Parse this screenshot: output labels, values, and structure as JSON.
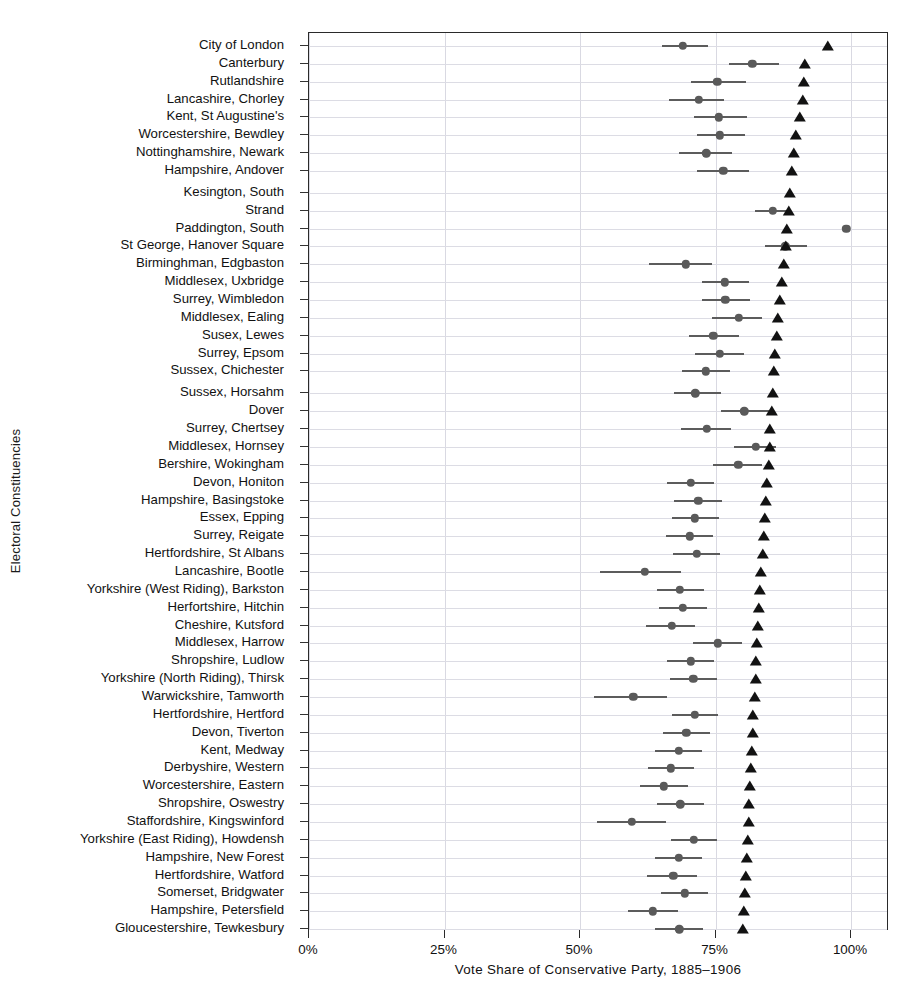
{
  "chart_data": {
    "type": "scatter",
    "title": "",
    "xlabel": "Vote Share of Conservative Party, 1885–1906",
    "ylabel": "Electoral Constituencies",
    "xlim": [
      0,
      107
    ],
    "xticks": [
      0,
      25,
      50,
      75,
      100
    ],
    "xticklabels": [
      "0%",
      "25%",
      "50%",
      "75%",
      "100%"
    ],
    "grid": true,
    "legend": false,
    "series": [
      {
        "name": "estimate-with-confidence-interval",
        "marker": "circle",
        "color": "#5a5a5a"
      },
      {
        "name": "reference-point",
        "marker": "triangle",
        "color": "#121212"
      }
    ],
    "categories": [
      "City of London",
      "Canterbury",
      "Rutlandshire",
      "Lancashire, Chorley",
      "Kent, St Augustine's",
      "Worcestershire, Bewdley",
      "Nottinghamshire, Newark",
      "Hampshire, Andover",
      "Kesington, South",
      "Strand",
      "Paddington, South",
      "St George, Hanover Square",
      "Birminghman, Edgbaston",
      "Middlesex, Uxbridge",
      "Surrey, Wimbledon",
      "Middlesex, Ealing",
      "Susex, Lewes",
      "Surrey, Epsom",
      "Sussex, Chichester",
      "Sussex, Horsahm",
      "Dover",
      "Surrey, Chertsey",
      "Middlesex, Hornsey",
      "Bershire, Wokingham",
      "Devon, Honiton",
      "Hampshire, Basingstoke",
      "Essex, Epping",
      "Surrey, Reigate",
      "Hertfordshire, St Albans",
      "Lancashire, Bootle",
      "Yorkshire (West Riding), Barkston",
      "Herfortshire, Hitchin",
      "Cheshire, Kutsford",
      "Middlesex, Harrow",
      "Shropshire, Ludlow",
      "Yorkshire (North Riding), Thirsk",
      "Warwickshire, Tamworth",
      "Hertfordshire, Hertford",
      "Devon, Tiverton",
      "Kent, Medway",
      "Derbyshire, Western",
      "Worcestershire, Eastern",
      "Shropshire, Oswestry",
      "Staffordshire, Kingswinford",
      "Yorkshire (East Riding), Howdensh",
      "Hampshire, New Forest",
      "Hertfordshire, Watford",
      "Somerset, Bridgwater",
      "Hampshire, Petersfield",
      "Gloucestershire, Tewkesbury"
    ],
    "gap_after_rows": [
      8,
      19
    ],
    "points": [
      {
        "category": "City of London",
        "estimate": 69.0,
        "ci_low": 65.2,
        "ci_high": 73.6,
        "reference": 95.8
      },
      {
        "category": "Canterbury",
        "estimate": 81.8,
        "ci_low": 77.5,
        "ci_high": 86.8,
        "reference": 91.5
      },
      {
        "category": "Rutlandshire",
        "estimate": 75.3,
        "ci_low": 70.5,
        "ci_high": 80.6,
        "reference": 91.4
      },
      {
        "category": "Lancashire, Chorley",
        "estimate": 71.9,
        "ci_low": 66.4,
        "ci_high": 76.5,
        "reference": 91.1
      },
      {
        "category": "Kent, St Augustine's",
        "estimate": 75.6,
        "ci_low": 71.1,
        "ci_high": 80.8,
        "reference": 90.5
      },
      {
        "category": "Worcestershire, Bewdley",
        "estimate": 75.8,
        "ci_low": 71.5,
        "ci_high": 80.4,
        "reference": 89.9
      },
      {
        "category": "Nottinghamshire, Newark",
        "estimate": 73.3,
        "ci_low": 68.2,
        "ci_high": 78.1,
        "reference": 89.5
      },
      {
        "category": "Hampshire, Andover",
        "estimate": 76.4,
        "ci_low": 71.5,
        "ci_high": 81.1,
        "reference": 89.1
      },
      {
        "category": "Kesington, South",
        "estimate": null,
        "ci_low": null,
        "ci_high": null,
        "reference": 88.7
      },
      {
        "category": "Strand",
        "estimate": 85.6,
        "ci_low": 82.3,
        "ci_high": 88.6,
        "reference": 88.5
      },
      {
        "category": "Paddington, South",
        "estimate": 99.1,
        "ci_low": null,
        "ci_high": null,
        "reference": 88.2
      },
      {
        "category": "St George, Hanover Square",
        "estimate": 87.9,
        "ci_low": 84.1,
        "ci_high": 91.9,
        "reference": 88.0
      },
      {
        "category": "Birminghman, Edgbaston",
        "estimate": 69.5,
        "ci_low": 62.8,
        "ci_high": 74.3,
        "reference": 87.6
      },
      {
        "category": "Middlesex, Uxbridge",
        "estimate": 76.7,
        "ci_low": 72.5,
        "ci_high": 81.1,
        "reference": 87.2
      },
      {
        "category": "Surrey, Wimbledon",
        "estimate": 76.8,
        "ci_low": 72.5,
        "ci_high": 81.3,
        "reference": 86.8
      },
      {
        "category": "Middlesex, Ealing",
        "estimate": 79.3,
        "ci_low": 74.4,
        "ci_high": 83.6,
        "reference": 86.6
      },
      {
        "category": "Susex, Lewes",
        "estimate": 74.6,
        "ci_low": 70.1,
        "ci_high": 79.3,
        "reference": 86.3
      },
      {
        "category": "Surrey, Epsom",
        "estimate": 75.8,
        "ci_low": 71.2,
        "ci_high": 80.2,
        "reference": 85.9
      },
      {
        "category": "Sussex, Chichester",
        "estimate": 73.2,
        "ci_low": 68.8,
        "ci_high": 77.6,
        "reference": 85.8
      },
      {
        "category": "Sussex, Horsahm",
        "estimate": 71.3,
        "ci_low": 67.4,
        "ci_high": 76.0,
        "reference": 85.6
      },
      {
        "category": "Dover",
        "estimate": 80.3,
        "ci_low": 76.0,
        "ci_high": 84.8,
        "reference": 85.4
      },
      {
        "category": "Surrey, Chertsey",
        "estimate": 73.4,
        "ci_low": 68.6,
        "ci_high": 77.9,
        "reference": 85.1
      },
      {
        "category": "Middlesex, Hornsey",
        "estimate": 82.4,
        "ci_low": 78.4,
        "ci_high": 86.2,
        "reference": 85.0
      },
      {
        "category": "Bershire, Wokingham",
        "estimate": 79.2,
        "ci_low": 74.5,
        "ci_high": 83.6,
        "reference": 84.8
      },
      {
        "category": "Devon, Honiton",
        "estimate": 70.4,
        "ci_low": 66.0,
        "ci_high": 74.8,
        "reference": 84.5
      },
      {
        "category": "Hampshire, Basingstoke",
        "estimate": 71.8,
        "ci_low": 67.4,
        "ci_high": 76.2,
        "reference": 84.3
      },
      {
        "category": "Essex, Epping",
        "estimate": 71.2,
        "ci_low": 66.9,
        "ci_high": 75.6,
        "reference": 84.1
      },
      {
        "category": "Surrey, Reigate",
        "estimate": 70.3,
        "ci_low": 65.9,
        "ci_high": 74.6,
        "reference": 83.9
      },
      {
        "category": "Hertfordshire, St Albans",
        "estimate": 71.5,
        "ci_low": 67.2,
        "ci_high": 75.8,
        "reference": 83.7
      },
      {
        "category": "Lancashire, Bootle",
        "estimate": 62.0,
        "ci_low": 53.6,
        "ci_high": 68.7,
        "reference": 83.4
      },
      {
        "category": "Yorkshire (West Riding), Barkston",
        "estimate": 68.4,
        "ci_low": 64.2,
        "ci_high": 72.9,
        "reference": 83.2
      },
      {
        "category": "Herfortshire, Hitchin",
        "estimate": 69.0,
        "ci_low": 64.5,
        "ci_high": 73.4,
        "reference": 83.0
      },
      {
        "category": "Cheshire, Kutsford",
        "estimate": 66.9,
        "ci_low": 62.2,
        "ci_high": 71.2,
        "reference": 82.9
      },
      {
        "category": "Middlesex, Harrow",
        "estimate": 75.4,
        "ci_low": 70.9,
        "ci_high": 79.8,
        "reference": 82.7
      },
      {
        "category": "Shropshire, Ludlow",
        "estimate": 70.4,
        "ci_low": 66.0,
        "ci_high": 74.7,
        "reference": 82.5
      },
      {
        "category": "Yorkshire (North Riding), Thirsk",
        "estimate": 70.9,
        "ci_low": 66.6,
        "ci_high": 75.2,
        "reference": 82.4
      },
      {
        "category": "Warwickshire, Tamworth",
        "estimate": 59.8,
        "ci_low": 52.6,
        "ci_high": 66.0,
        "reference": 82.2
      },
      {
        "category": "Hertfordshire, Hertford",
        "estimate": 71.2,
        "ci_low": 66.9,
        "ci_high": 75.5,
        "reference": 82.0
      },
      {
        "category": "Devon, Tiverton",
        "estimate": 69.6,
        "ci_low": 65.3,
        "ci_high": 73.9,
        "reference": 81.9
      },
      {
        "category": "Kent, Medway",
        "estimate": 68.2,
        "ci_low": 63.8,
        "ci_high": 72.5,
        "reference": 81.7
      },
      {
        "category": "Derbyshire, Western",
        "estimate": 66.8,
        "ci_low": 62.5,
        "ci_high": 71.1,
        "reference": 81.6
      },
      {
        "category": "Worcestershire, Eastern",
        "estimate": 65.5,
        "ci_low": 61.0,
        "ci_high": 70.0,
        "reference": 81.4
      },
      {
        "category": "Shropshire, Oswestry",
        "estimate": 68.5,
        "ci_low": 64.2,
        "ci_high": 72.8,
        "reference": 81.2
      },
      {
        "category": "Staffordshire, Kingswinford",
        "estimate": 59.6,
        "ci_low": 53.2,
        "ci_high": 65.8,
        "reference": 81.1
      },
      {
        "category": "Yorkshire (East Riding), Howdensh",
        "estimate": 71.0,
        "ci_low": 66.8,
        "ci_high": 75.3,
        "reference": 80.9
      },
      {
        "category": "Hampshire, New Forest",
        "estimate": 68.2,
        "ci_low": 63.9,
        "ci_high": 72.5,
        "reference": 80.8
      },
      {
        "category": "Hertfordshire, Watford",
        "estimate": 67.2,
        "ci_low": 62.3,
        "ci_high": 71.6,
        "reference": 80.6
      },
      {
        "category": "Somerset, Bridgwater",
        "estimate": 69.3,
        "ci_low": 64.9,
        "ci_high": 73.6,
        "reference": 80.5
      },
      {
        "category": "Hampshire, Petersfield",
        "estimate": 63.4,
        "ci_low": 58.8,
        "ci_high": 68.0,
        "reference": 80.3
      },
      {
        "category": "Gloucestershire, Tewkesbury",
        "estimate": 68.3,
        "ci_low": 63.9,
        "ci_high": 72.7,
        "reference": 80.1
      }
    ]
  }
}
